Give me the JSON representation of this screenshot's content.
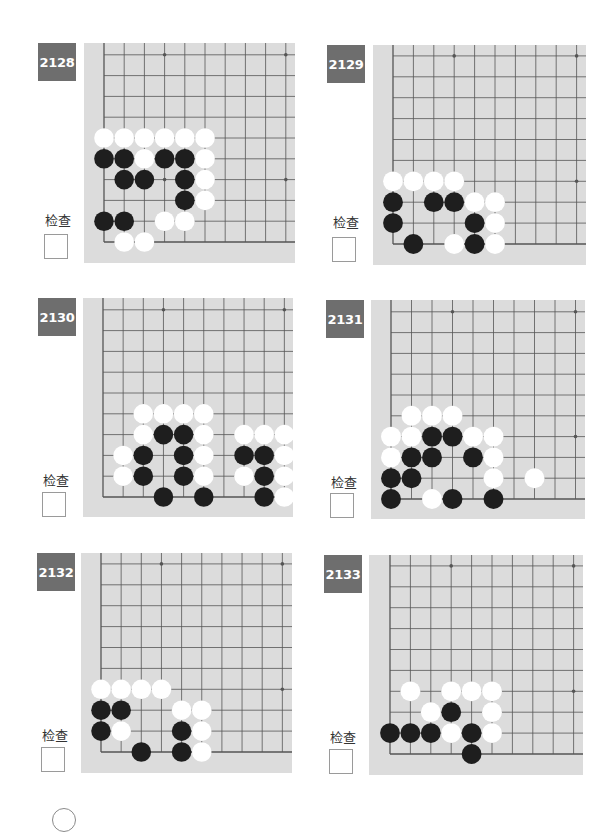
{
  "page": {
    "check_label": "检查",
    "colors": {
      "badge": "#6e6e6e",
      "board": "#dcdcdc",
      "grid_line": "#555555",
      "black_stone": "#1e1e1e",
      "white_stone": "#ffffff"
    }
  },
  "problems": [
    {
      "number": "2128",
      "badge": {
        "x": 38,
        "y": 43
      },
      "label": {
        "x": 45,
        "y": 210
      },
      "checkbox": {
        "x": 44,
        "y": 234
      },
      "board": {
        "x": 84,
        "y": 43,
        "w": 211,
        "h": 220,
        "x0": 104,
        "y0": 242,
        "dx": 20.2,
        "dy": 20.8
      },
      "stones": {
        "black": [
          [
            0,
            4
          ],
          [
            1,
            4
          ],
          [
            3,
            4
          ],
          [
            4,
            4
          ],
          [
            1,
            3
          ],
          [
            2,
            3
          ],
          [
            4,
            3
          ],
          [
            4,
            2
          ],
          [
            0,
            1
          ],
          [
            1,
            1
          ]
        ],
        "white": [
          [
            0,
            5
          ],
          [
            1,
            5
          ],
          [
            2,
            5
          ],
          [
            3,
            5
          ],
          [
            4,
            5
          ],
          [
            5,
            5
          ],
          [
            2,
            4
          ],
          [
            5,
            4
          ],
          [
            5,
            3
          ],
          [
            5,
            2
          ],
          [
            3,
            1
          ],
          [
            4,
            1
          ],
          [
            1,
            0
          ],
          [
            2,
            0
          ]
        ]
      }
    },
    {
      "number": "2129",
      "badge": {
        "x": 327,
        "y": 45
      },
      "label": {
        "x": 333,
        "y": 212
      },
      "checkbox": {
        "x": 332,
        "y": 237
      },
      "board": {
        "x": 373,
        "y": 45,
        "w": 213,
        "h": 220,
        "x0": 393,
        "y0": 244,
        "dx": 20.4,
        "dy": 20.9
      },
      "stones": {
        "black": [
          [
            0,
            2
          ],
          [
            2,
            2
          ],
          [
            3,
            2
          ],
          [
            0,
            1
          ],
          [
            4,
            1
          ],
          [
            1,
            0
          ],
          [
            4,
            0
          ]
        ],
        "white": [
          [
            0,
            3
          ],
          [
            1,
            3
          ],
          [
            2,
            3
          ],
          [
            3,
            3
          ],
          [
            4,
            2
          ],
          [
            5,
            2
          ],
          [
            5,
            1
          ],
          [
            3,
            0
          ],
          [
            5,
            0
          ]
        ]
      }
    },
    {
      "number": "2130",
      "badge": {
        "x": 38,
        "y": 298
      },
      "label": {
        "x": 43,
        "y": 470
      },
      "checkbox": {
        "x": 42,
        "y": 492
      },
      "board": {
        "x": 83,
        "y": 298,
        "w": 210,
        "h": 219,
        "x0": 103,
        "y0": 497,
        "dx": 20.15,
        "dy": 20.8
      },
      "stones": {
        "black": [
          [
            3,
            3
          ],
          [
            4,
            3
          ],
          [
            2,
            2
          ],
          [
            4,
            2
          ],
          [
            7,
            2
          ],
          [
            8,
            2
          ],
          [
            2,
            1
          ],
          [
            4,
            1
          ],
          [
            8,
            1
          ],
          [
            3,
            0
          ],
          [
            5,
            0
          ],
          [
            8,
            0
          ]
        ],
        "white": [
          [
            2,
            4
          ],
          [
            3,
            4
          ],
          [
            4,
            4
          ],
          [
            5,
            4
          ],
          [
            2,
            3
          ],
          [
            5,
            3
          ],
          [
            7,
            3
          ],
          [
            8,
            3
          ],
          [
            9,
            3
          ],
          [
            1,
            2
          ],
          [
            5,
            2
          ],
          [
            9,
            2
          ],
          [
            1,
            1
          ],
          [
            5,
            1
          ],
          [
            7,
            1
          ],
          [
            9,
            1
          ],
          [
            9,
            0
          ]
        ]
      }
    },
    {
      "number": "2131",
      "badge": {
        "x": 326,
        "y": 300
      },
      "label": {
        "x": 331,
        "y": 472
      },
      "checkbox": {
        "x": 330,
        "y": 493
      },
      "board": {
        "x": 371,
        "y": 300,
        "w": 214,
        "h": 219,
        "x0": 391,
        "y0": 499,
        "dx": 20.5,
        "dy": 20.8
      },
      "stones": {
        "black": [
          [
            2,
            3
          ],
          [
            3,
            3
          ],
          [
            1,
            2
          ],
          [
            2,
            2
          ],
          [
            4,
            2
          ],
          [
            0,
            1
          ],
          [
            1,
            1
          ],
          [
            0,
            0
          ],
          [
            3,
            0
          ],
          [
            5,
            0
          ]
        ],
        "white": [
          [
            1,
            4
          ],
          [
            2,
            4
          ],
          [
            3,
            4
          ],
          [
            0,
            3
          ],
          [
            1,
            3
          ],
          [
            4,
            3
          ],
          [
            5,
            3
          ],
          [
            0,
            2
          ],
          [
            5,
            2
          ],
          [
            5,
            1
          ],
          [
            7,
            1
          ],
          [
            2,
            0
          ]
        ]
      }
    },
    {
      "number": "2132",
      "badge": {
        "x": 37,
        "y": 553
      },
      "label": {
        "x": 42,
        "y": 725
      },
      "checkbox": {
        "x": 41,
        "y": 747
      },
      "board": {
        "x": 81,
        "y": 553,
        "w": 211,
        "h": 220,
        "x0": 101,
        "y0": 752,
        "dx": 20.15,
        "dy": 20.9
      },
      "stones": {
        "black": [
          [
            0,
            2
          ],
          [
            1,
            2
          ],
          [
            0,
            1
          ],
          [
            4,
            1
          ],
          [
            2,
            0
          ],
          [
            4,
            0
          ]
        ],
        "white": [
          [
            0,
            3
          ],
          [
            1,
            3
          ],
          [
            2,
            3
          ],
          [
            3,
            3
          ],
          [
            4,
            2
          ],
          [
            5,
            2
          ],
          [
            1,
            1
          ],
          [
            5,
            1
          ],
          [
            5,
            0
          ]
        ]
      }
    },
    {
      "number": "2133",
      "badge": {
        "x": 324,
        "y": 555
      },
      "label": {
        "x": 330,
        "y": 727
      },
      "checkbox": {
        "x": 329,
        "y": 749
      },
      "board": {
        "x": 369,
        "y": 555,
        "w": 214,
        "h": 220,
        "x0": 390,
        "y0": 754,
        "dx": 20.4,
        "dy": 20.9
      },
      "stones": {
        "black": [
          [
            3,
            2
          ],
          [
            0,
            1
          ],
          [
            1,
            1
          ],
          [
            2,
            1
          ],
          [
            4,
            1
          ],
          [
            4,
            0
          ]
        ],
        "white": [
          [
            1,
            3
          ],
          [
            3,
            3
          ],
          [
            4,
            3
          ],
          [
            5,
            3
          ],
          [
            2,
            2
          ],
          [
            5,
            2
          ],
          [
            3,
            1
          ],
          [
            5,
            1
          ]
        ]
      }
    }
  ]
}
